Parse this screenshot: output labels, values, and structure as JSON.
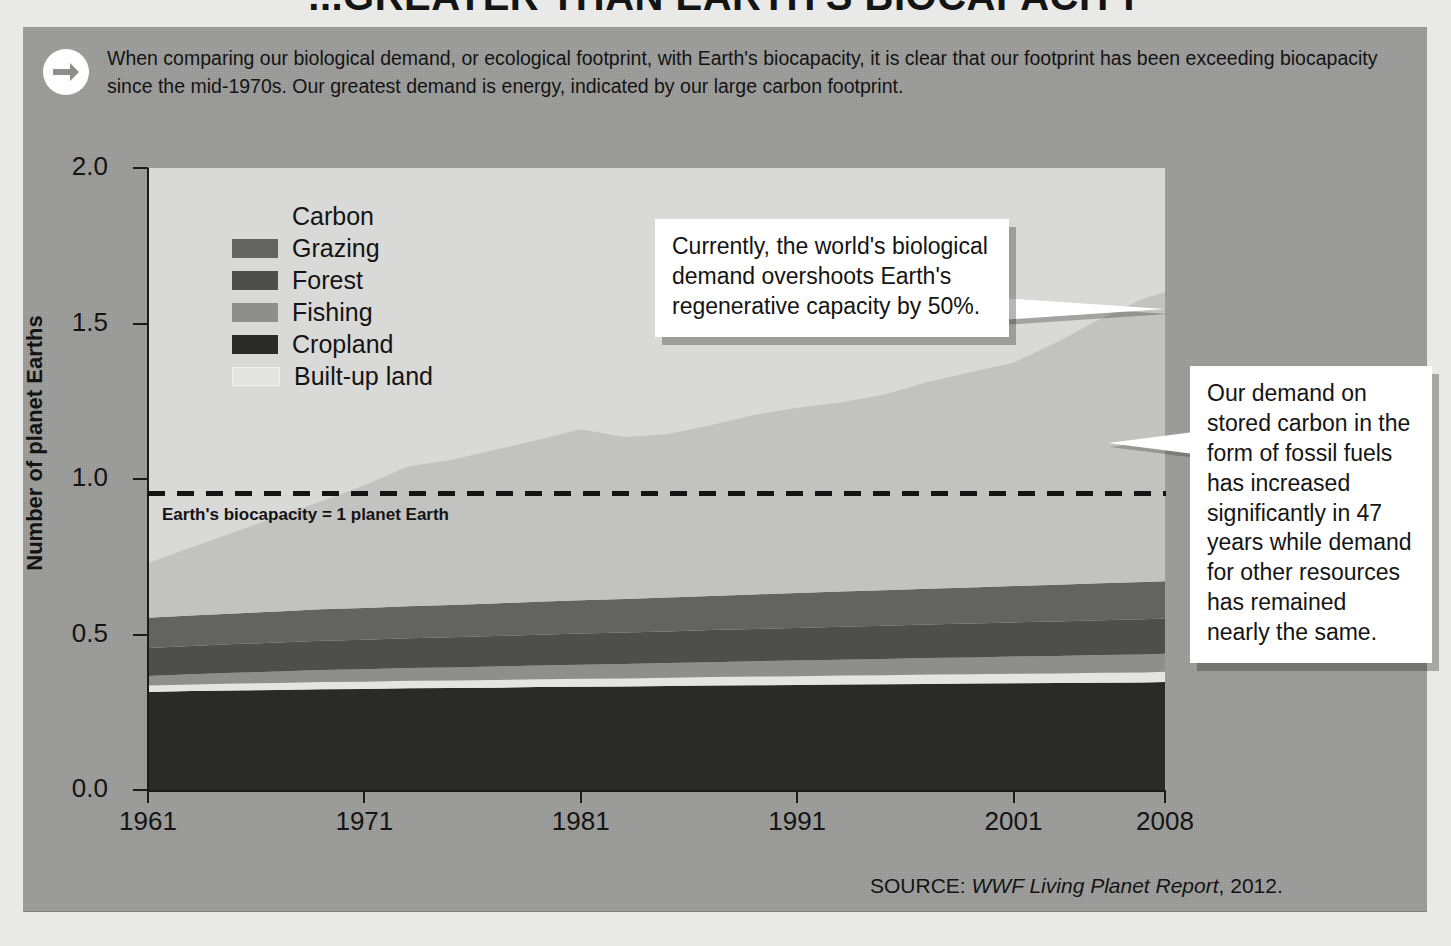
{
  "title": "...GREATER THAN EARTH'S BIOCAPACITY",
  "intro": {
    "icon": "arrow-right-icon",
    "text": "When comparing our biological demand, or ecological footprint, with Earth's biocapacity, it is clear that our footprint has been exceeding biocapacity since the mid-1970s. Our greatest demand is energy, indicated by our large carbon footprint."
  },
  "legend": {
    "items": [
      {
        "label": "Carbon",
        "color": "#c2c2c0"
      },
      {
        "label": "Grazing",
        "color": "#636361"
      },
      {
        "label": "Forest",
        "color": "#4e4e4c"
      },
      {
        "label": "Fishing",
        "color": "#8e8e8c"
      },
      {
        "label": "Cropland",
        "color": "#2a2a28"
      },
      {
        "label": "Built-up land",
        "color": "#e4e4e2"
      }
    ]
  },
  "annotations": {
    "biocapacity_line_label": "Earth's biocapacity = 1 planet Earth",
    "callout_overshoot": "Currently, the world's biological demand overshoots Earth's regenerative capacity by 50%.",
    "callout_carbon": "Our demand on stored carbon in the form of fossil fuels has increased significantly in 47 years while demand for other resources has remained nearly the same."
  },
  "source": {
    "prefix": "SOURCE: ",
    "italic": "WWF Living Planet Report",
    "suffix": ", 2012."
  },
  "chart_data": {
    "type": "area",
    "title": "...greater than Earth's biocapacity",
    "xlabel": "",
    "ylabel": "Number of planet Earths",
    "xlim": [
      1961,
      2008
    ],
    "ylim": [
      0.0,
      2.0
    ],
    "yticks": [
      "0.0",
      "0.5",
      "1.0",
      "1.5",
      "2.0"
    ],
    "xticks": [
      "1961",
      "1971",
      "1981",
      "1991",
      "2001",
      "2008"
    ],
    "grid": false,
    "legend_position": "upper-left-inside",
    "stacked": true,
    "reference_line": {
      "value": 1.0,
      "style": "dashed",
      "label": "Earth's biocapacity = 1 planet Earth"
    },
    "x": [
      1961,
      1963,
      1965,
      1967,
      1969,
      1971,
      1973,
      1975,
      1977,
      1979,
      1981,
      1983,
      1985,
      1987,
      1989,
      1991,
      1993,
      1995,
      1997,
      1999,
      2001,
      2003,
      2005,
      2007,
      2008
    ],
    "series": [
      {
        "name": "Cropland",
        "color": "#2a2a28",
        "values": [
          0.315,
          0.318,
          0.32,
          0.322,
          0.324,
          0.325,
          0.327,
          0.328,
          0.329,
          0.331,
          0.332,
          0.333,
          0.334,
          0.336,
          0.337,
          0.338,
          0.339,
          0.34,
          0.341,
          0.342,
          0.343,
          0.344,
          0.345,
          0.346,
          0.347
        ]
      },
      {
        "name": "Built-up land",
        "color": "#e4e4e2",
        "values": [
          0.021,
          0.021,
          0.022,
          0.022,
          0.023,
          0.023,
          0.024,
          0.024,
          0.025,
          0.025,
          0.026,
          0.026,
          0.027,
          0.027,
          0.028,
          0.028,
          0.029,
          0.029,
          0.03,
          0.03,
          0.031,
          0.031,
          0.032,
          0.032,
          0.033
        ]
      },
      {
        "name": "Fishing",
        "color": "#8e8e8c",
        "values": [
          0.031,
          0.033,
          0.035,
          0.037,
          0.039,
          0.04,
          0.041,
          0.042,
          0.043,
          0.044,
          0.045,
          0.046,
          0.047,
          0.048,
          0.049,
          0.05,
          0.051,
          0.052,
          0.053,
          0.054,
          0.055,
          0.056,
          0.057,
          0.058,
          0.058
        ]
      },
      {
        "name": "Forest",
        "color": "#4e4e4c",
        "values": [
          0.09,
          0.091,
          0.092,
          0.093,
          0.094,
          0.095,
          0.096,
          0.097,
          0.098,
          0.099,
          0.1,
          0.101,
          0.102,
          0.103,
          0.104,
          0.105,
          0.106,
          0.107,
          0.108,
          0.109,
          0.11,
          0.111,
          0.112,
          0.113,
          0.113
        ]
      },
      {
        "name": "Grazing",
        "color": "#636361",
        "values": [
          0.097,
          0.098,
          0.099,
          0.1,
          0.101,
          0.102,
          0.103,
          0.104,
          0.105,
          0.106,
          0.107,
          0.108,
          0.109,
          0.11,
          0.111,
          0.112,
          0.113,
          0.114,
          0.115,
          0.116,
          0.117,
          0.118,
          0.119,
          0.12,
          0.12
        ]
      },
      {
        "name": "Carbon",
        "color": "#c2c2c0",
        "values": [
          0.176,
          0.219,
          0.262,
          0.306,
          0.347,
          0.395,
          0.449,
          0.466,
          0.493,
          0.52,
          0.55,
          0.521,
          0.525,
          0.549,
          0.577,
          0.596,
          0.608,
          0.629,
          0.664,
          0.692,
          0.718,
          0.78,
          0.849,
          0.911,
          0.929
        ]
      }
    ],
    "totals": [
      0.73,
      0.78,
      0.83,
      0.88,
      0.928,
      0.98,
      1.04,
      1.061,
      1.093,
      1.125,
      1.16,
      1.135,
      1.144,
      1.173,
      1.206,
      1.229,
      1.247,
      1.271,
      1.311,
      1.343,
      1.374,
      1.44,
      1.514,
      1.58,
      1.6
    ]
  }
}
